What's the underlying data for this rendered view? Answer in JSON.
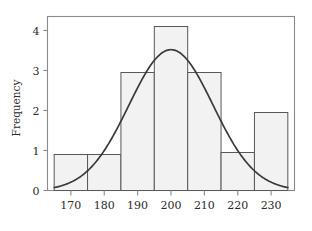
{
  "chart_data": {
    "type": "bar",
    "title": "",
    "subtitle": "",
    "xlabel": "",
    "ylabel": "Frequency",
    "grid": false,
    "legend": false,
    "legend_position": "none",
    "bin_width": 10,
    "bin_edges": [
      165,
      175,
      185,
      195,
      205,
      215,
      225,
      235
    ],
    "categories": [
      "165-175",
      "175-185",
      "185-195",
      "195-205",
      "205-215",
      "215-225",
      "225-235"
    ],
    "values": [
      0.9,
      0.9,
      2.95,
      4.1,
      2.95,
      0.95,
      1.95
    ],
    "xlim": [
      163,
      237
    ],
    "ylim": [
      0,
      4.35
    ],
    "xticks": [
      170,
      180,
      190,
      200,
      210,
      220,
      230
    ],
    "xtick_labels": [
      "170",
      "180",
      "190",
      "200",
      "210",
      "220",
      "230"
    ],
    "yticks": [
      0,
      1,
      2,
      3,
      4
    ],
    "ytick_labels": [
      "0",
      "1",
      "2",
      "3",
      "4"
    ],
    "overlay": {
      "type": "line",
      "name": "normal-density-curve",
      "peak_x": 200,
      "peak_y": 3.52,
      "sigma": 12.6,
      "x_start": 165,
      "x_end": 235,
      "y_start": 0.27,
      "y_end": 0.33
    },
    "colors": {
      "bar_fill": "#f2f2f2",
      "bar_border": "#585858",
      "curve": "#3a3a3a",
      "frame": "#8a8a8a",
      "text": "#2b2b2b",
      "background": "#ffffff"
    }
  },
  "axes": {
    "y_title": "Frequency"
  }
}
